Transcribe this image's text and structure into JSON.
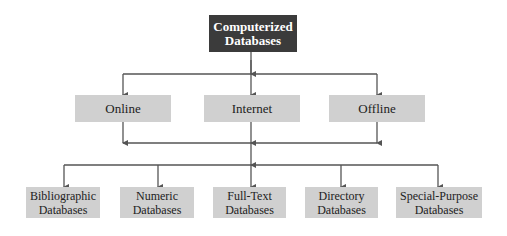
{
  "diagram": {
    "root": {
      "line1": "Computerized",
      "line2": "Databases"
    },
    "access_modes": [
      {
        "label": "Online"
      },
      {
        "label": "Internet"
      },
      {
        "label": "Offline"
      }
    ],
    "types": [
      {
        "line1": "Bibliographic",
        "line2": "Databases"
      },
      {
        "line1": "Numeric",
        "line2": "Databases"
      },
      {
        "line1": "Full-Text",
        "line2": "Databases"
      },
      {
        "line1": "Directory",
        "line2": "Databases"
      },
      {
        "line1": "Special-Purpose",
        "line2": "Databases"
      }
    ],
    "colors": {
      "root_fill": "#3b3b3b",
      "root_text": "#ffffff",
      "node_fill": "#d0d0d0",
      "node_text": "#222222",
      "connector": "#555555"
    }
  }
}
